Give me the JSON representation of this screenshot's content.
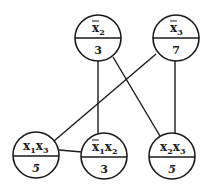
{
  "diagram": {
    "type": "graph",
    "colors": {
      "stroke": "#1a1a1a",
      "background": "#ffffff"
    },
    "nodes": [
      {
        "id": "n_x2bar",
        "label_base": "x",
        "label_sub": "2",
        "negated": true,
        "second_base": "",
        "second_sub": "",
        "second_negated": false,
        "value": "3",
        "cx": 98,
        "cy": 38
      },
      {
        "id": "n_x3bar",
        "label_base": "x",
        "label_sub": "3",
        "negated": true,
        "second_base": "",
        "second_sub": "",
        "second_negated": false,
        "value": "7",
        "cx": 176,
        "cy": 38
      },
      {
        "id": "n_x1x3",
        "label_base": "x",
        "label_sub": "1",
        "negated": false,
        "second_base": "x",
        "second_sub": "3",
        "second_negated": false,
        "value": "5",
        "cx": 36,
        "cy": 155
      },
      {
        "id": "n_x1barx2",
        "label_base": "x",
        "label_sub": "1",
        "negated": true,
        "second_base": "x",
        "second_sub": "2",
        "second_negated": false,
        "value": "3",
        "cx": 104,
        "cy": 156
      },
      {
        "id": "n_x2x3",
        "label_base": "x",
        "label_sub": "2",
        "negated": false,
        "second_base": "x",
        "second_sub": "3",
        "second_negated": false,
        "value": "5",
        "cx": 172,
        "cy": 156
      }
    ],
    "edges": [
      {
        "from": "n_x2bar",
        "to": "n_x1barx2"
      },
      {
        "from": "n_x2bar",
        "to": "n_x2x3"
      },
      {
        "from": "n_x3bar",
        "to": "n_x1x3"
      },
      {
        "from": "n_x3bar",
        "to": "n_x2x3"
      },
      {
        "from": "n_x1x3",
        "to": "n_x1barx2"
      }
    ],
    "labels": {
      "n_x2bar": "x̄2",
      "n_x3bar": "x̄3",
      "n_x1x3": "x1x3",
      "n_x1barx2": "x̄1x2",
      "n_x2x3": "x2x3"
    }
  }
}
